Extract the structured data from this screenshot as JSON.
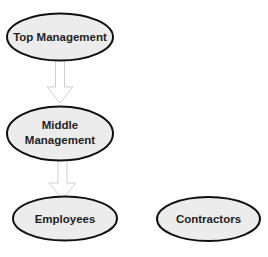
{
  "diagram": {
    "type": "hierarchy",
    "colors": {
      "node_fill": "#ececec",
      "node_stroke": "#111111",
      "arrow_stroke": "#cfcfcf",
      "arrow_fill": "#ffffff",
      "text": "#1e1e1e"
    },
    "nodes": [
      {
        "id": "top",
        "label_lines": [
          "Top Management"
        ],
        "cx": 60,
        "cy": 37,
        "rx": 53,
        "ry": 23.5
      },
      {
        "id": "middle",
        "label_lines": [
          "Middle",
          "Management"
        ],
        "cx": 60,
        "cy": 133.5,
        "rx": 53,
        "ry": 27
      },
      {
        "id": "employees",
        "label_lines": [
          "Employees"
        ],
        "cx": 65,
        "cy": 218.5,
        "rx": 52,
        "ry": 22
      },
      {
        "id": "contractors",
        "label_lines": [
          "Contractors"
        ],
        "cx": 208.5,
        "cy": 219,
        "rx": 51.5,
        "ry": 22
      }
    ],
    "edges": [
      {
        "from": "top",
        "to": "middle"
      },
      {
        "from": "middle",
        "to": "employees"
      }
    ]
  }
}
